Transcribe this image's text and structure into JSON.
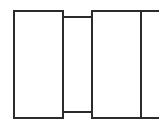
{
  "figure": {
    "kind": "technical-line-drawing",
    "canvas": {
      "width": 167,
      "height": 131,
      "background": "#ffffff"
    },
    "stroke": {
      "color": "#2b2b2b",
      "width": 2
    },
    "segments": [
      {
        "name": "left-segment",
        "shape": "rectangle",
        "x": 14,
        "y": 11,
        "width": 49,
        "height": 107
      },
      {
        "name": "middle-segment",
        "shape": "rectangle",
        "x": 63,
        "y": 17,
        "width": 29,
        "height": 95
      },
      {
        "name": "right-segment",
        "shape": "rectangle",
        "x": 92,
        "y": 11,
        "width": 49,
        "height": 107
      }
    ],
    "stubs": [
      {
        "name": "top-right-stub",
        "shape": "line",
        "x1": 141,
        "y1": 11,
        "x2": 158,
        "y2": 11
      },
      {
        "name": "bottom-right-stub",
        "shape": "line",
        "x1": 141,
        "y1": 118,
        "x2": 158,
        "y2": 118
      }
    ]
  }
}
